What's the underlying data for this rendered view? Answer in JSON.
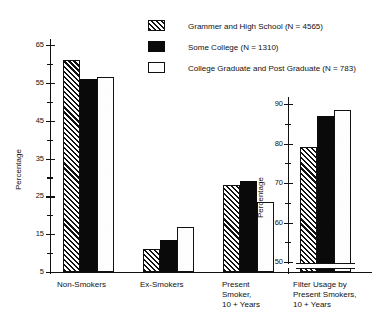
{
  "figure": {
    "legend": [
      {
        "id": "grammer-high-school",
        "label": "Grammer and High School (N  =  4565)",
        "pattern": "hatch"
      },
      {
        "id": "some-college",
        "label": "Some College (N  =  1310)",
        "pattern": "solid"
      },
      {
        "id": "college-graduate",
        "label": "College Graduate and Post Graduate (N  =  783)",
        "pattern": "dots"
      }
    ]
  },
  "chart_data": [
    {
      "type": "bar",
      "id": "main-smoking-status-chart",
      "title": "",
      "xlabel": "",
      "ylabel": "Percentage",
      "ylim": [
        5,
        65
      ],
      "yticks": [
        5,
        15,
        25,
        35,
        45,
        55,
        65
      ],
      "yticks_minor": [
        10,
        20,
        30,
        40,
        50,
        60
      ],
      "ytick_labels": [
        "5",
        "15",
        "25",
        "35",
        "45",
        "55",
        "65"
      ],
      "grid": false,
      "legend_position": "top-right",
      "categories": [
        "Non-Smokers",
        "Ex-Smokers",
        "Present\nSmoker,\n10 +  Years"
      ],
      "series": [
        {
          "name": "Grammer and High School (N  =  4565)",
          "pattern": "hatch",
          "values": [
            61.0,
            11.0,
            28.0
          ]
        },
        {
          "name": "Some College (N  =  1310)",
          "pattern": "solid",
          "values": [
            56.0,
            13.5,
            29.0
          ]
        },
        {
          "name": "College Graduate and Post Graduate (N  =  783)",
          "pattern": "dots",
          "values": [
            56.5,
            17.0,
            23.5
          ]
        }
      ]
    },
    {
      "type": "bar",
      "id": "filter-usage-inset-chart",
      "title": "",
      "xlabel": "",
      "ylabel": "Percentage",
      "ylim": [
        47,
        90
      ],
      "axis_break": true,
      "yticks": [
        50,
        60,
        70,
        80,
        90
      ],
      "yticks_minor": [
        55,
        65,
        75,
        85
      ],
      "ytick_labels": [
        "50",
        "60",
        "70",
        "80",
        "90"
      ],
      "grid": false,
      "categories": [
        "Filter Usage by\nPresent Smokers,\n10 +  Years"
      ],
      "series": [
        {
          "name": "Grammer and High School (N  =  4565)",
          "pattern": "hatch",
          "values": [
            79.0
          ]
        },
        {
          "name": "Some College (N  =  1310)",
          "pattern": "solid",
          "values": [
            87.0
          ]
        },
        {
          "name": "College Graduate and Post Graduate (N  =  783)",
          "pattern": "dots",
          "values": [
            88.5
          ]
        }
      ]
    }
  ],
  "axes": {
    "main": {
      "ylabel": "Percentage"
    },
    "inset": {
      "ylabel": "Percentage"
    }
  },
  "category_labels": {
    "main": [
      "Non-Smokers",
      "Ex-Smokers",
      "Present\nSmoker,\n10 +  Years"
    ],
    "inset": [
      "Filter Usage by\nPresent Smokers,\n10 +  Years"
    ]
  }
}
